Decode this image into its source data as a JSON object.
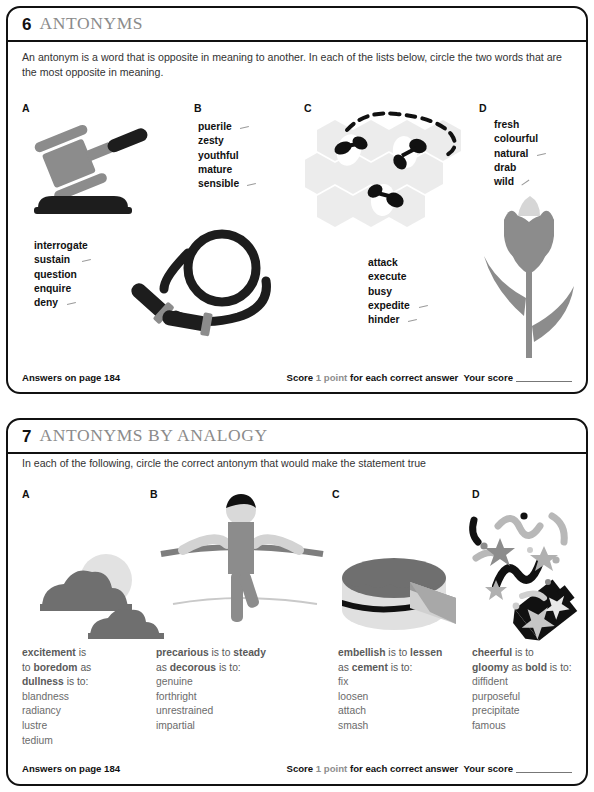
{
  "page": {
    "background": "#ffffff",
    "ink": "#111111",
    "title_gray": "#8b8b8b",
    "illustration_gray": "#8c8c8c",
    "illustration_light": "#d6d6d6",
    "illustration_dark": "#1d1d1d"
  },
  "puzzles": [
    {
      "number": "6",
      "title": "ANTONYMS",
      "instruction": "An antonym is a word that is opposite in meaning to another. In each of the lists below, circle the two words that are the most opposite in meaning.",
      "type": "word-list",
      "columns": [
        {
          "letter": "A",
          "illustration": "gavel-icon",
          "words": [
            {
              "text": "interrogate",
              "marked": false
            },
            {
              "text": "sustain",
              "marked": true
            },
            {
              "text": "question",
              "marked": false
            },
            {
              "text": "enquire",
              "marked": false
            },
            {
              "text": "deny",
              "marked": true
            }
          ]
        },
        {
          "letter": "B",
          "illustration": "skipping-rope-icon",
          "words": [
            {
              "text": "puerile",
              "marked": true
            },
            {
              "text": "zesty",
              "marked": false
            },
            {
              "text": "youthful",
              "marked": false
            },
            {
              "text": "mature",
              "marked": false
            },
            {
              "text": "sensible",
              "marked": true
            }
          ]
        },
        {
          "letter": "C",
          "illustration": "honeycomb-bees-icon",
          "words": [
            {
              "text": "attack",
              "marked": false
            },
            {
              "text": "execute",
              "marked": false
            },
            {
              "text": "busy",
              "marked": false
            },
            {
              "text": "expedite",
              "marked": true
            },
            {
              "text": "hinder",
              "marked": true
            }
          ]
        },
        {
          "letter": "D",
          "illustration": "tulip-icon",
          "words": [
            {
              "text": "fresh",
              "marked": false
            },
            {
              "text": "colourful",
              "marked": false
            },
            {
              "text": "natural",
              "marked": true
            },
            {
              "text": "drab",
              "marked": false
            },
            {
              "text": "wild",
              "marked": true
            }
          ]
        }
      ],
      "footer": {
        "answers": "Answers on page 184",
        "score_prefix": "Score",
        "score_points": "1 point",
        "score_suffix": "for each correct answer",
        "your_score": "Your score"
      }
    },
    {
      "number": "7",
      "title": "ANTONYMS BY ANALOGY",
      "instruction": "In each of the following, circle the correct antonym that would make the statement true",
      "type": "analogy",
      "columns": [
        {
          "letter": "A",
          "illustration": "sun-clouds-icon",
          "stem_lines": [
            [
              {
                "t": "excitement",
                "b": true
              },
              {
                "t": " is",
                "b": false
              }
            ],
            [
              {
                "t": "to ",
                "b": false
              },
              {
                "t": "boredom",
                "b": true
              },
              {
                "t": " as",
                "b": false
              }
            ],
            [
              {
                "t": "dullness",
                "b": true
              },
              {
                "t": " is to:",
                "b": false
              }
            ]
          ],
          "options": [
            "blandness",
            "radiancy",
            "lustre",
            "tedium"
          ]
        },
        {
          "letter": "B",
          "illustration": "tightrope-walker-icon",
          "stem_lines": [
            [
              {
                "t": "precarious",
                "b": true
              },
              {
                "t": " is to ",
                "b": false
              },
              {
                "t": "steady",
                "b": true
              }
            ],
            [
              {
                "t": "as ",
                "b": false
              },
              {
                "t": "decorous",
                "b": true
              },
              {
                "t": " is to:",
                "b": false
              }
            ]
          ],
          "options": [
            "genuine",
            "forthright",
            "unrestrained",
            "impartial"
          ]
        },
        {
          "letter": "C",
          "illustration": "cake-slice-icon",
          "stem_lines": [
            [
              {
                "t": "embellish",
                "b": true
              },
              {
                "t": " is to ",
                "b": false
              },
              {
                "t": "lessen",
                "b": true
              }
            ],
            [
              {
                "t": "as ",
                "b": false
              },
              {
                "t": "cement",
                "b": true
              },
              {
                "t": " is to:",
                "b": false
              }
            ]
          ],
          "options": [
            "fix",
            "loosen",
            "attach",
            "smash"
          ]
        },
        {
          "letter": "D",
          "illustration": "party-popper-icon",
          "stem_lines": [
            [
              {
                "t": "cheerful",
                "b": true
              },
              {
                "t": " is to",
                "b": false
              }
            ],
            [
              {
                "t": "gloomy",
                "b": true
              },
              {
                "t": " as ",
                "b": false
              },
              {
                "t": "bold",
                "b": true
              },
              {
                "t": " is to:",
                "b": false
              }
            ]
          ],
          "options": [
            "diffident",
            "purposeful",
            "precipitate",
            "famous"
          ]
        }
      ],
      "footer": {
        "answers": "Answers on page 184",
        "score_prefix": "Score",
        "score_points": "1 point",
        "score_suffix": "for each correct answer",
        "your_score": "Your score"
      }
    }
  ]
}
